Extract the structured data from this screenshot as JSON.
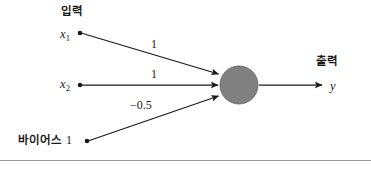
{
  "figure": {
    "type": "neural-network-perceptron-diagram",
    "title": "",
    "background_color": "#ffffff",
    "line_color": "#1a1a1a",
    "text_color": "#1a1a1a",
    "neuron_fill_color": "#808080",
    "neuron_stroke_color": "#5a5a5a",
    "rule_color": "#9a9a9a"
  },
  "headers": {
    "input": "입력",
    "output": "출력"
  },
  "inputs": [
    {
      "label": "x",
      "subscript": "1"
    },
    {
      "label": "x",
      "subscript": "2"
    }
  ],
  "bias": {
    "label": "바이어스",
    "value": "1"
  },
  "weights": [
    {
      "from": "x1",
      "value": "1"
    },
    {
      "from": "x2",
      "value": "1"
    },
    {
      "from": "bias",
      "value": "−0.5"
    }
  ],
  "output": {
    "label": "y"
  },
  "neuron": {
    "cx": 239,
    "cy": 85,
    "r": 19
  }
}
